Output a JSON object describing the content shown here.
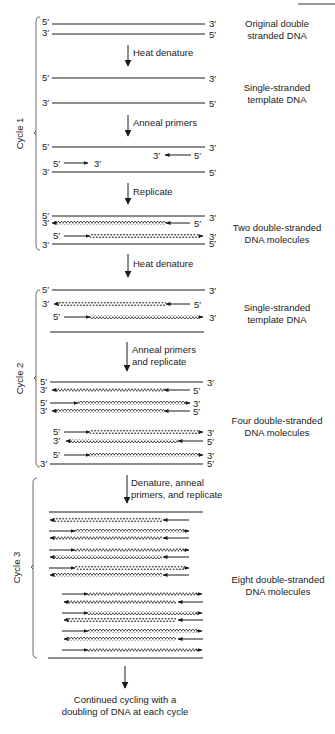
{
  "figure": {
    "corner_rule": true
  },
  "labels": {
    "five_prime": "5′",
    "three_prime": "3′"
  },
  "steps": {
    "heat_denature_1": "Heat denature",
    "anneal_primers": "Anneal primers",
    "replicate": "Replicate",
    "heat_denature_2": "Heat denature",
    "anneal_replicate_l1": "Anneal primers",
    "anneal_replicate_l2": "and replicate",
    "denature_anneal_l1": "Denature, anneal",
    "denature_anneal_l2": "primers, and replicate"
  },
  "descriptions": {
    "original_l1": "Original double",
    "original_l2": "stranded DNA",
    "single_l1": "Single-stranded",
    "single_l2": "template DNA",
    "two_l1": "Two double-stranded",
    "two_l2": "DNA molecules",
    "single2_l1": "Single-stranded",
    "single2_l2": "template DNA",
    "four_l1": "Four double-stranded",
    "four_l2": "DNA molecules",
    "eight_l1": "Eight double-stranded",
    "eight_l2": "DNA molecules"
  },
  "cycles": {
    "c1": "Cycle 1",
    "c2": "Cycle 2",
    "c3": "Cycle 3"
  },
  "footer": {
    "line1": "Continued cycling with a",
    "line2": "doubling of DNA at each cycle"
  },
  "colors": {
    "ink": "#1a1a1a",
    "background": "#ffffff"
  }
}
